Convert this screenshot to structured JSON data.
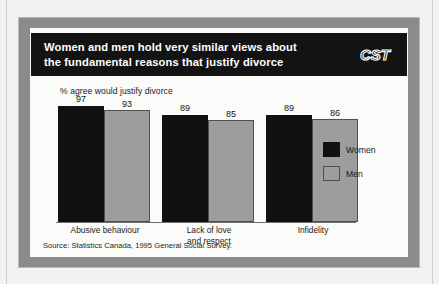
{
  "header": {
    "title": "Women and men hold very similar views about\nthe fundamental reasons that justify divorce",
    "logo_text": "CST",
    "logo_icon": "cst-wordmark-icon",
    "background_color": "#131313",
    "text_color": "#ffffff"
  },
  "frame": {
    "border_color": "#8b8b8b",
    "panel_color": "#fbfbfa"
  },
  "source": {
    "text": "Source: Statistics Canada, 1995 General Social Survey."
  },
  "legend": {
    "position": "right",
    "entries": [
      {
        "label": "Women",
        "color": "#111111"
      },
      {
        "label": "Men",
        "color": "#9d9d9d"
      }
    ]
  },
  "chart_data": {
    "type": "bar",
    "title": "Women and men hold very similar views about the fundamental reasons that justify divorce",
    "subtitle": "",
    "xlabel": "",
    "ylabel": "% agree would justify divorce",
    "ylim": [
      0,
      100
    ],
    "grid": false,
    "legend_position": "right",
    "categories": [
      "Abusive behaviour",
      "Lack of love\nand respect",
      "Infidelity"
    ],
    "series": [
      {
        "name": "Women",
        "color": "#111111",
        "values": [
          97,
          89,
          89
        ]
      },
      {
        "name": "Men",
        "color": "#9d9d9d",
        "values": [
          93,
          85,
          86
        ]
      }
    ],
    "annotations": [
      "Source: Statistics Canada, 1995 General Social Survey."
    ]
  }
}
